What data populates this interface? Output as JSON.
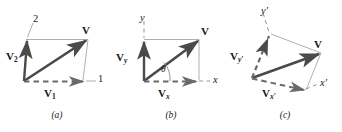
{
  "figure": {
    "type": "vector-decomposition-diagram",
    "stroke_color": "#3a3a3a",
    "bold_stroke_color": "#4a4a4a",
    "thin_stroke_color": "#8a8a8a",
    "text_color": "#1a1a1a",
    "background": "#ffffff",
    "panels": [
      {
        "id": "a",
        "caption": "(a)",
        "axes": {
          "first": "1",
          "second": "2"
        },
        "labels": {
          "resultant": "V",
          "component_1": "V",
          "component_1_sub": "1",
          "component_2": "V",
          "component_2_sub": "2"
        }
      },
      {
        "id": "b",
        "caption": "(b)",
        "axes": {
          "first": "x",
          "second": "y"
        },
        "labels": {
          "resultant": "V",
          "component_x": "V",
          "component_x_sub": "x",
          "component_y": "V",
          "component_y_sub": "y",
          "angle": "θ"
        }
      },
      {
        "id": "c",
        "caption": "(c)",
        "axes": {
          "first": "x′",
          "second": "y′"
        },
        "labels": {
          "resultant": "V",
          "component_x": "V",
          "component_x_sub": "x′",
          "component_y": "V",
          "component_y_sub": "y′"
        }
      }
    ]
  }
}
